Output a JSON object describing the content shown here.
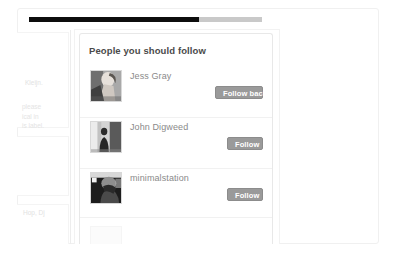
{
  "progress": {
    "name": "page-load-progress",
    "percent": 73
  },
  "sidebar": {
    "clipped_text_1": "Kleijn.",
    "clipped_paragraph": [
      "please",
      "ical in",
      "is label."
    ],
    "clipped_text_2": "Hop, Dj"
  },
  "widget": {
    "title": "People you should follow",
    "rows": [
      {
        "name": "Jess Gray",
        "avatar_icon": "avatar-photo-jess-gray",
        "button_label": "Follow back",
        "button_width": "wide"
      },
      {
        "name": "John Digweed",
        "avatar_icon": "avatar-photo-john-digweed",
        "button_label": "Follow",
        "button_width": "narrow"
      },
      {
        "name": "minimalstation",
        "avatar_icon": "avatar-photo-minimalstation",
        "button_label": "Follow",
        "button_width": "narrow"
      }
    ],
    "partial_row_name": ""
  },
  "colors": {
    "button_gray": "#9a9a9a",
    "title_text": "#4a4a4a",
    "name_text": "#8a8a8a",
    "progress_dark": "#0d0d0d",
    "progress_track": "#c9c9c9",
    "card_border": "#e8e8e8"
  }
}
